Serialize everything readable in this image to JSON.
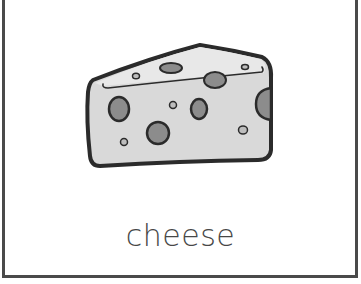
{
  "card": {
    "word": "cheese",
    "illustration": {
      "subject": "cheese-wedge",
      "colors": {
        "outline": "#2b2b2b",
        "cheese_fill": "#d9d9d9",
        "top_face_fill": "#e6e6e6",
        "hole_fill": "#8c8c8c"
      }
    },
    "border_color": "#4a4a4a",
    "text_color": "#474747"
  }
}
